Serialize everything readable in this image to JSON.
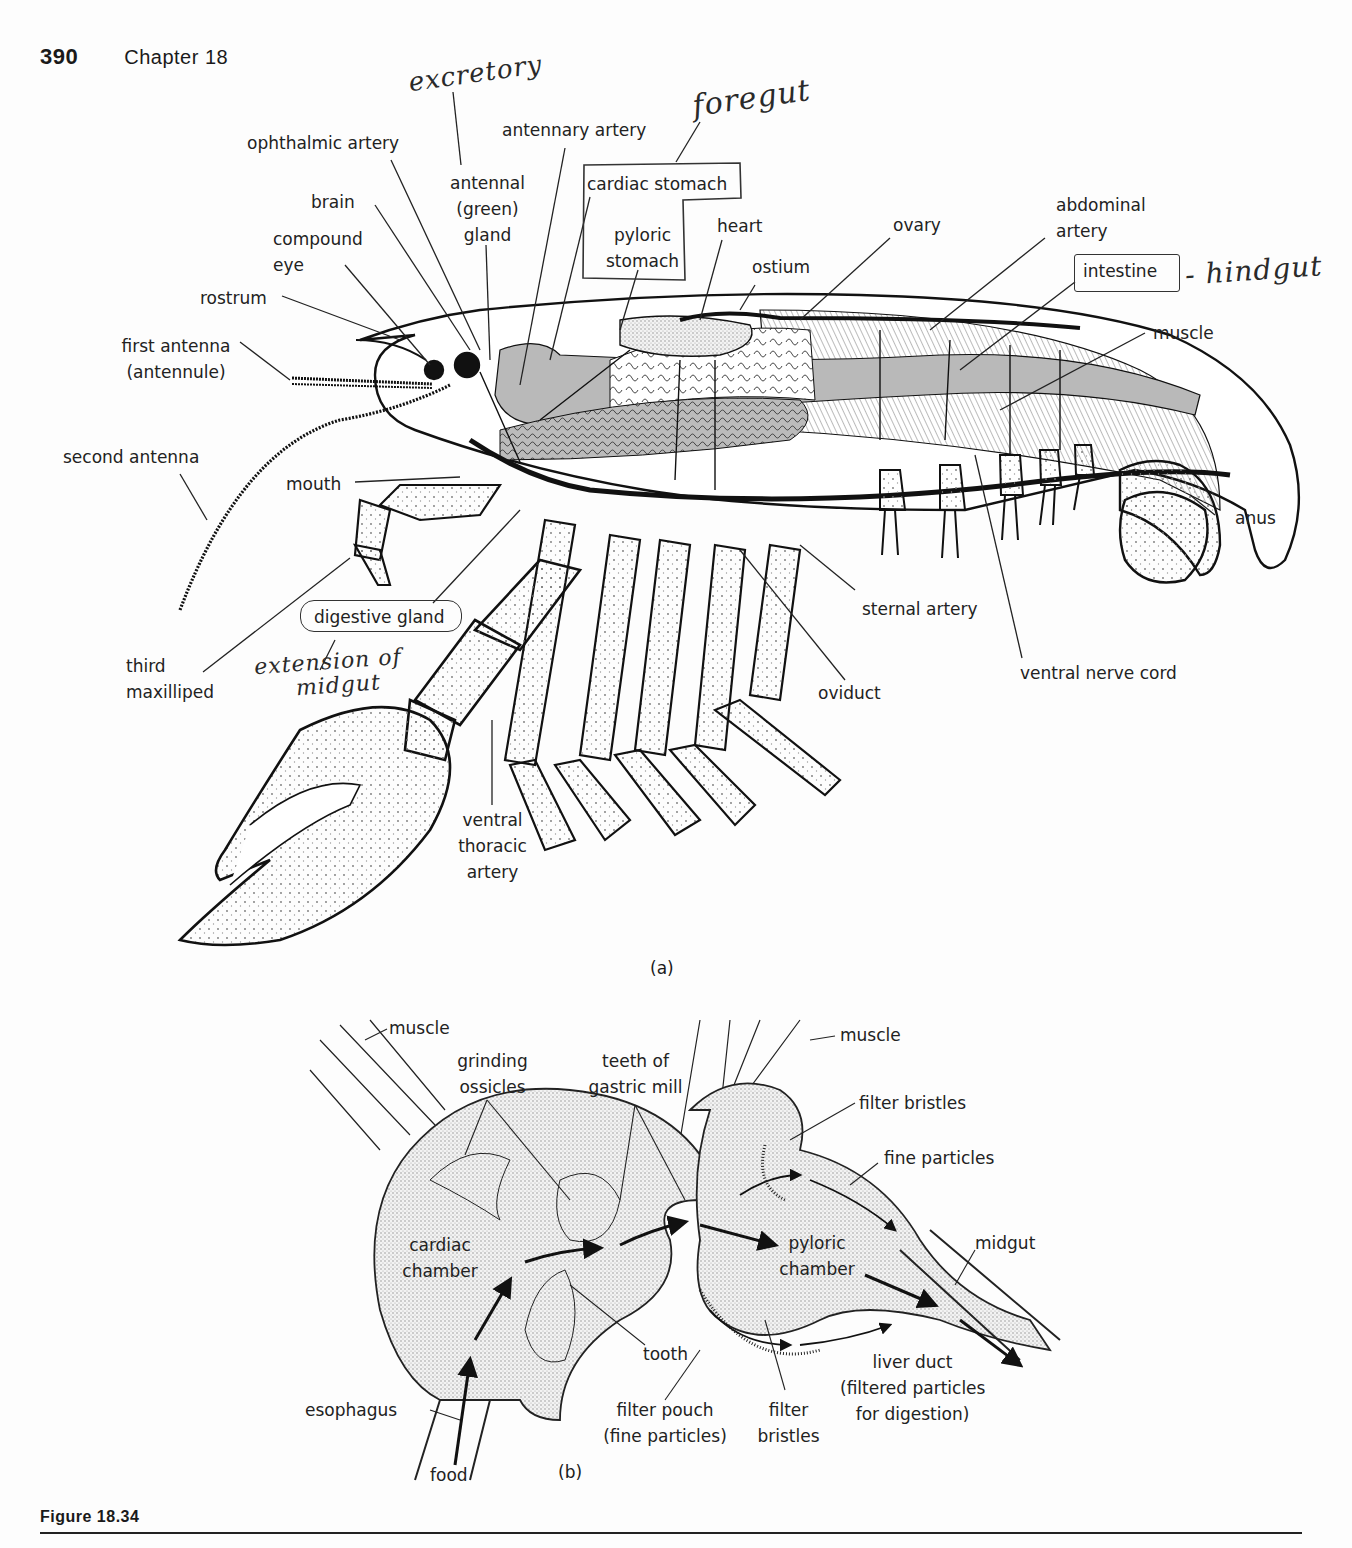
{
  "header": {
    "page_number": "390",
    "chapter": "Chapter 18"
  },
  "figure": {
    "caption": "Figure 18.34",
    "panel_a_label": "(a)",
    "panel_b_label": "(b)"
  },
  "panel_a": {
    "labels": {
      "ophthalmic_artery": "ophthalmic artery",
      "brain": "brain",
      "compound_eye_1": "compound",
      "compound_eye_2": "eye",
      "rostrum": "rostrum",
      "first_antenna_1": "first antenna",
      "first_antenna_2": "(antennule)",
      "second_antenna": "second antenna",
      "mouth": "mouth",
      "third_maxilliped_1": "third",
      "third_maxilliped_2": "maxilliped",
      "digestive_gland": "digestive gland",
      "antennal_gland_1": "antennal",
      "antennal_gland_2": "(green)",
      "antennal_gland_3": "gland",
      "antennary_artery": "antennary artery",
      "cardiac_stomach": "cardiac stomach",
      "pyloric_stomach_1": "pyloric",
      "pyloric_stomach_2": "stomach",
      "heart": "heart",
      "ostium": "ostium",
      "ovary": "ovary",
      "abdominal_artery_1": "abdominal",
      "abdominal_artery_2": "artery",
      "intestine": "intestine",
      "muscle": "muscle",
      "anus": "anus",
      "sternal_artery": "sternal artery",
      "ventral_nerve_cord": "ventral nerve cord",
      "oviduct": "oviduct",
      "ventral_thoracic_artery_1": "ventral",
      "ventral_thoracic_artery_2": "thoracic",
      "ventral_thoracic_artery_3": "artery"
    },
    "handwritten": {
      "excretory": "excretory",
      "foregut": "foregut",
      "hindgut": "- hindgut",
      "extension_1": "extension of",
      "extension_2": "midgut"
    }
  },
  "panel_b": {
    "labels": {
      "muscle_left": "muscle",
      "muscle_right": "muscle",
      "grinding_ossicles_1": "grinding",
      "grinding_ossicles_2": "ossicles",
      "teeth_1": "teeth of",
      "teeth_2": "gastric mill",
      "filter_bristles_top": "filter bristles",
      "fine_particles": "fine particles",
      "cardiac_chamber_1": "cardiac",
      "cardiac_chamber_2": "chamber",
      "pyloric_chamber_1": "pyloric",
      "pyloric_chamber_2": "chamber",
      "midgut": "midgut",
      "tooth": "tooth",
      "liver_duct_1": "liver duct",
      "liver_duct_2": "(filtered particles",
      "liver_duct_3": "for digestion)",
      "esophagus": "esophagus",
      "filter_pouch_1": "filter pouch",
      "filter_pouch_2": "(fine particles)",
      "filter_bristles_bottom_1": "filter",
      "filter_bristles_bottom_2": "bristles",
      "food": "food"
    }
  }
}
